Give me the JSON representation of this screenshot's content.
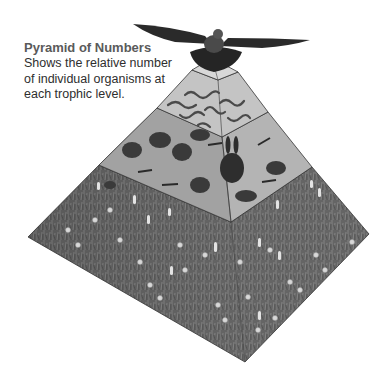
{
  "caption": {
    "title": "Pyramid of Numbers",
    "description_lines": [
      "Shows the relative number",
      "of individual organisms at",
      "each trophic level."
    ]
  },
  "pyramid": {
    "levels": [
      {
        "id": "apex",
        "label": "tertiary consumer",
        "organism": "eagle",
        "count": 1
      },
      {
        "id": "level-3",
        "label": "secondary consumers",
        "organism": "snakes",
        "count": 7
      },
      {
        "id": "level-2",
        "label": "primary consumers",
        "organism": "rodents, rabbit, grasshoppers",
        "count": 18
      },
      {
        "id": "level-1",
        "label": "producers",
        "organism": "grasses and wildflowers",
        "count": "many"
      }
    ],
    "colors": {
      "base_grass": "#6a6a6a",
      "level_face_light": "#c8c8c8",
      "level_face_mid": "#a6a6a6",
      "edge": "#3a3a3a",
      "eagle": "#2a2a2a"
    }
  }
}
